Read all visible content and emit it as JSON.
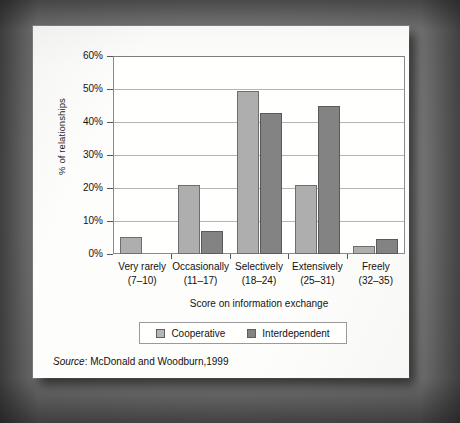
{
  "chart_data": {
    "type": "bar",
    "title": "",
    "xlabel": "Score on information exchange",
    "ylabel": "% of relationships",
    "categories": [
      "Very rarely",
      "Occasionally",
      "Selectively",
      "Extensively",
      "Freely"
    ],
    "category_ranges": [
      "(7–10)",
      "(11–17)",
      "(18–24)",
      "(25–31)",
      "(32–35)"
    ],
    "series": [
      {
        "name": "Cooperative",
        "color": "#aeaeae",
        "values": [
          5.3,
          21.0,
          49.5,
          20.8,
          2.3
        ]
      },
      {
        "name": "Interdependent",
        "color": "#838383",
        "values": [
          0.0,
          7.0,
          42.7,
          45.0,
          4.5
        ]
      }
    ],
    "ylim": [
      0,
      60
    ],
    "ytick_values": [
      0,
      10,
      20,
      30,
      40,
      50,
      60
    ],
    "ytick_labels": [
      "0%",
      "10%",
      "20%",
      "30%",
      "40%",
      "50%",
      "60%"
    ],
    "grid": true,
    "legend_position": "bottom"
  },
  "source": {
    "label": "Source",
    "separator": ":",
    "text": "McDonald and Woodburn,1999"
  }
}
